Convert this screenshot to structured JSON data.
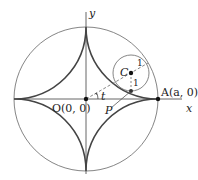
{
  "diagram": {
    "labels": {
      "y_axis": "y",
      "x_axis": "x",
      "origin": "O(0, 0)",
      "point_a": "A(a, 0)",
      "center": "C",
      "point_p": "P",
      "angle": "t",
      "radius_label_1": "1",
      "radius_label_2": "1"
    },
    "colors": {
      "stroke": "#555555",
      "curve": "#444444",
      "dot": "#111111",
      "text": "#222222"
    },
    "geometry": {
      "origin_px": [
        86,
        99
      ],
      "big_radius_px": 72,
      "small_circle_center_px": [
        131,
        73
      ],
      "small_radius_px": 18,
      "tangent_point_px": [
        131,
        91
      ]
    }
  }
}
